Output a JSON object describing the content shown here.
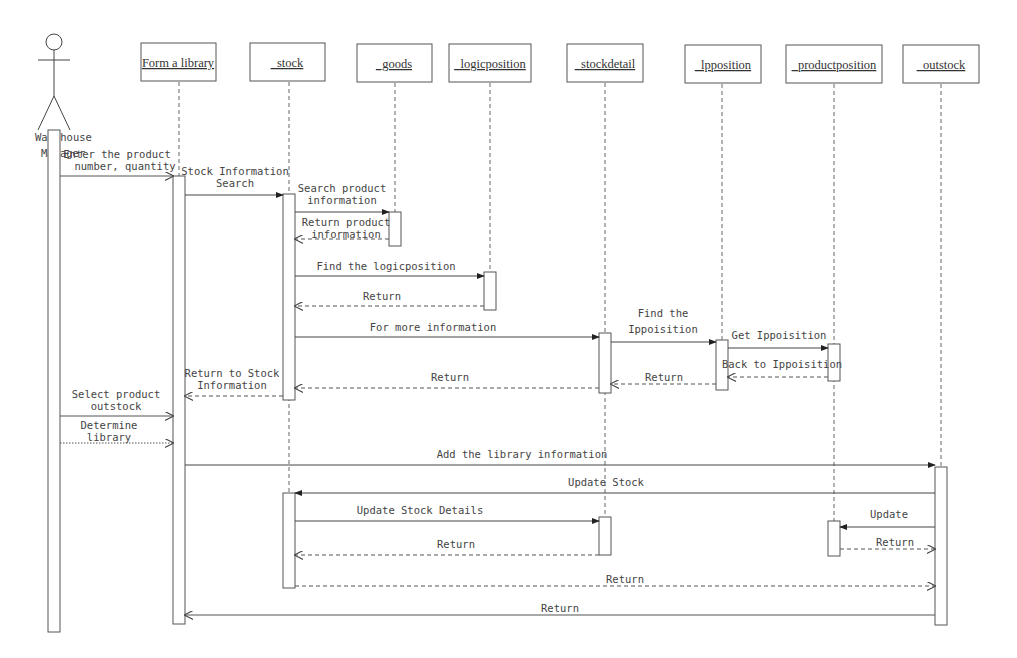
{
  "diagram": {
    "type": "UML sequence diagram",
    "actor": {
      "name": "Warehouse Manager",
      "line1": "Warehouse",
      "line2": "Manager"
    },
    "objects": [
      {
        "id": "formlib",
        "label": "Form a library"
      },
      {
        "id": "stock",
        "label": "_stock"
      },
      {
        "id": "goods",
        "label": "_goods"
      },
      {
        "id": "logicposition",
        "label": "_logicposition"
      },
      {
        "id": "stockdetail",
        "label": "_stockdetail"
      },
      {
        "id": "lpposition",
        "label": "_lpposition"
      },
      {
        "id": "productposition",
        "label": "_productposition"
      },
      {
        "id": "outstock",
        "label": "_outstock"
      }
    ],
    "messages": [
      {
        "n": 1,
        "from": "Warehouse Manager",
        "to": "Form a library",
        "kind": "call",
        "l1": "Enter the product",
        "l2": "number, quantity"
      },
      {
        "n": 2,
        "from": "Form a library",
        "to": "stock",
        "kind": "call",
        "l1": "Stock Information",
        "l2": "Search"
      },
      {
        "n": 3,
        "from": "stock",
        "to": "goods",
        "kind": "call",
        "l1": "Search product",
        "l2": "information"
      },
      {
        "n": 4,
        "from": "goods",
        "to": "stock",
        "kind": "return",
        "l1": "Return product",
        "l2": "information"
      },
      {
        "n": 5,
        "from": "stock",
        "to": "logicposition",
        "kind": "call",
        "l1": "Find the logicposition"
      },
      {
        "n": 6,
        "from": "logicposition",
        "to": "stock",
        "kind": "return",
        "l1": "Return"
      },
      {
        "n": 7,
        "from": "stock",
        "to": "stockdetail",
        "kind": "call",
        "l1": "For more information"
      },
      {
        "n": 8,
        "from": "stockdetail",
        "to": "lpposition",
        "kind": "call",
        "l1": "Find the",
        "l2": "Ippoisition"
      },
      {
        "n": 9,
        "from": "lpposition",
        "to": "productposition",
        "kind": "call",
        "l1": "Get Ippoisition"
      },
      {
        "n": 10,
        "from": "productposition",
        "to": "lpposition",
        "kind": "return",
        "l1": "Back to Ippoisition"
      },
      {
        "n": 11,
        "from": "lpposition",
        "to": "stockdetail",
        "kind": "return",
        "l1": "Return"
      },
      {
        "n": 12,
        "from": "stockdetail",
        "to": "stock",
        "kind": "return",
        "l1": "Return"
      },
      {
        "n": 13,
        "from": "stock",
        "to": "Form a library",
        "kind": "return",
        "l1": "Return to Stock",
        "l2": "Information"
      },
      {
        "n": 14,
        "from": "Warehouse Manager",
        "to": "Form a library",
        "kind": "call",
        "l1": "Select product",
        "l2": "outstock"
      },
      {
        "n": 15,
        "from": "Warehouse Manager",
        "to": "Form a library",
        "kind": "call",
        "l1": "Determine",
        "l2": "library"
      },
      {
        "n": 16,
        "from": "Form a library",
        "to": "outstock",
        "kind": "call",
        "l1": "Add the library information"
      },
      {
        "n": 17,
        "from": "outstock",
        "to": "stock",
        "kind": "call",
        "l1": "Update Stock"
      },
      {
        "n": 18,
        "from": "stock",
        "to": "stockdetail",
        "kind": "call",
        "l1": "Update Stock Details"
      },
      {
        "n": 19,
        "from": "stockdetail",
        "to": "stock",
        "kind": "return",
        "l1": "Return"
      },
      {
        "n": 20,
        "from": "outstock",
        "to": "productposition",
        "kind": "call",
        "l1": "Update"
      },
      {
        "n": 21,
        "from": "productposition",
        "to": "outstock",
        "kind": "return",
        "l1": "Return"
      },
      {
        "n": 22,
        "from": "stock",
        "to": "outstock",
        "kind": "return",
        "l1": "Return"
      },
      {
        "n": 23,
        "from": "outstock",
        "to": "Form a library",
        "kind": "return",
        "l1": "Return"
      }
    ]
  }
}
